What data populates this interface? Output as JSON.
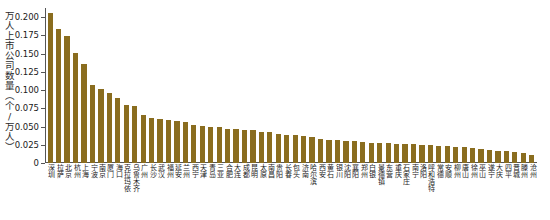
{
  "chart_data": {
    "type": "bar",
    "title": "",
    "subtitle": "",
    "xlabel": "",
    "ylabel": "万人上市公司数量（个/万人）",
    "ylim": [
      0,
      0.2125
    ],
    "ytick_labels": [
      "0",
      "0.025",
      "0.050",
      "0.075",
      "0.100",
      "0.125",
      "0.150",
      "0.175",
      "0.200"
    ],
    "ytick_values": [
      0,
      0.025,
      0.05,
      0.075,
      0.1,
      0.125,
      0.15,
      0.175,
      0.2
    ],
    "grid": false,
    "legend": false,
    "bar_color": "#8a6d1f",
    "axis_color": "#555555",
    "categories": [
      "深圳",
      "拉萨",
      "北京",
      "杭州",
      "上海",
      "宁波",
      "南京",
      "厦门",
      "海口",
      "克拉玛依",
      "乌鲁木齐",
      "广州",
      "长沙",
      "武汉",
      "福州",
      "延安",
      "兰州",
      "西宁",
      "天津",
      "青岛",
      "三亚",
      "合肥",
      "大连",
      "成都",
      "昆明",
      "太原",
      "南昌",
      "贵阳",
      "长春",
      "包头",
      "济南",
      "哈尔滨",
      "西安",
      "黄石",
      "银川",
      "沈阳",
      "襄阳",
      "郑州",
      "白银",
      "景德镇",
      "东营",
      "重庆",
      "石家庄",
      "南宁",
      "洛阳",
      "呼和浩特",
      "常德",
      "安顺",
      "柳州",
      "唐山",
      "徐州",
      "巫山",
      "遂宁",
      "大庆",
      "四平",
      "晋城",
      "滕州",
      "沧州"
    ],
    "values": [
      0.206,
      0.184,
      0.1735,
      0.151,
      0.136,
      0.1075,
      0.102,
      0.0955,
      0.0895,
      0.08,
      0.078,
      0.066,
      0.062,
      0.06,
      0.0595,
      0.058,
      0.0565,
      0.0525,
      0.0505,
      0.05,
      0.049,
      0.047,
      0.0465,
      0.0455,
      0.045,
      0.043,
      0.042,
      0.04,
      0.039,
      0.038,
      0.037,
      0.0355,
      0.033,
      0.032,
      0.031,
      0.03,
      0.0295,
      0.029,
      0.028,
      0.0275,
      0.027,
      0.0265,
      0.026,
      0.0255,
      0.025,
      0.0245,
      0.024,
      0.0235,
      0.0225,
      0.0215,
      0.0205,
      0.0195,
      0.0185,
      0.017,
      0.016,
      0.015,
      0.0135,
      0.0115
    ]
  },
  "caption": {
    "text": ""
  }
}
